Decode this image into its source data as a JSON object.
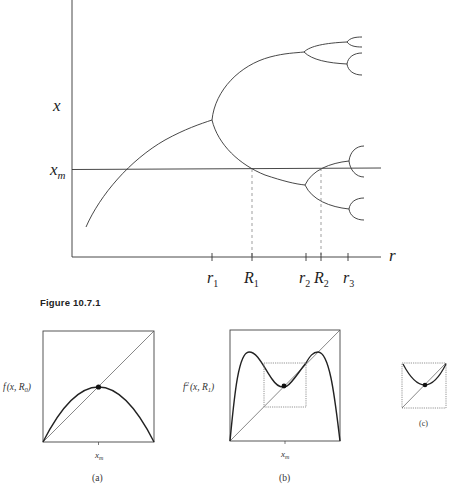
{
  "figure": {
    "caption": "Figure 10.7.1"
  },
  "main_diagram": {
    "y_axis_label": "x",
    "x_axis_label": "r",
    "xm_label": "x",
    "xm_sub": "m",
    "ticks": [
      {
        "base": "r",
        "sub": "1",
        "x": 212
      },
      {
        "base": "R",
        "sub": "1",
        "x": 252
      },
      {
        "base": "r",
        "sub": "2",
        "x": 306
      },
      {
        "base": "R",
        "sub": "2",
        "x": 321
      },
      {
        "base": "r",
        "sub": "3",
        "x": 348
      }
    ],
    "colors": {
      "stroke": "#333333",
      "dashed": "#666666"
    }
  },
  "panels": [
    {
      "id": "a",
      "label": "(a)",
      "ylabel_prefix": "f",
      "ylabel_sup": "",
      "ylabel_args": "(x, R",
      "ylabel_sub": "0",
      "xlabel": "x",
      "xlabel_sub": "m"
    },
    {
      "id": "b",
      "label": "(b)",
      "ylabel_prefix": "f",
      "ylabel_sup": "2",
      "ylabel_args": "(x, R",
      "ylabel_sub": "1",
      "xlabel": "x",
      "xlabel_sub": "m"
    },
    {
      "id": "c",
      "label": "(c)"
    }
  ]
}
